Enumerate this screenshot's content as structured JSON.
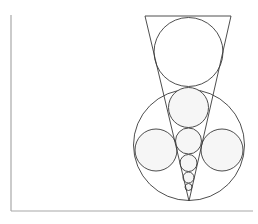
{
  "diagram": {
    "title": "",
    "colors": {
      "stroke": "#3a3a3a",
      "axis": "#a8a8a8",
      "circle_fill": "#f6f6f6",
      "background": "#ffffff"
    },
    "elements": [
      {
        "kind": "trapezoid",
        "label": "funnel"
      },
      {
        "kind": "circle",
        "label": "top-circle"
      },
      {
        "kind": "circle",
        "label": "large-circle"
      },
      {
        "kind": "circle",
        "label": "upper-inner-circle"
      },
      {
        "kind": "circle",
        "label": "left-side-circle"
      },
      {
        "kind": "circle",
        "label": "right-side-circle"
      },
      {
        "kind": "circle",
        "label": "middle-circle"
      },
      {
        "kind": "circle",
        "label": "small-circle"
      },
      {
        "kind": "circle",
        "label": "smaller-circle"
      },
      {
        "kind": "circle",
        "label": "tiny-circle"
      }
    ]
  }
}
